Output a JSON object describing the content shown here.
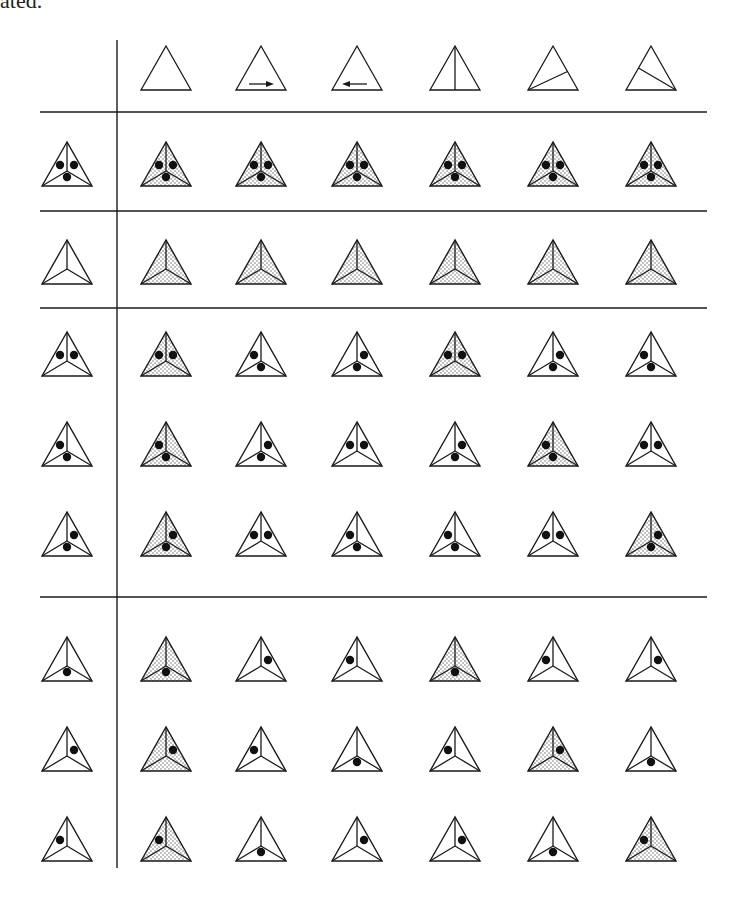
{
  "page": {
    "corner_text": "ated.",
    "background": "#ffffff",
    "ink": "#1a1a1a",
    "shade_dot": "#555555"
  },
  "grid": {
    "vertical_line": {
      "x": 117,
      "y1": 40,
      "y2": 868
    },
    "horizontal_lines": [
      {
        "y": 112,
        "x1": 40,
        "x2": 707
      },
      {
        "y": 211,
        "x1": 40,
        "x2": 707
      },
      {
        "y": 308,
        "x1": 40,
        "x2": 707
      },
      {
        "y": 597,
        "x1": 40,
        "x2": 707
      }
    ],
    "row_header_x": 67,
    "column_x": [
      166,
      261,
      357,
      455,
      553,
      651
    ],
    "header_row_y": 90,
    "row_y": [
      186,
      284,
      376,
      466,
      556,
      681,
      771,
      861
    ]
  },
  "column_headers": [
    {
      "id": "c1",
      "kind": "plain"
    },
    {
      "id": "c2",
      "kind": "arrow-right"
    },
    {
      "id": "c3",
      "kind": "arrow-left"
    },
    {
      "id": "c4",
      "kind": "vertical-split"
    },
    {
      "id": "c5",
      "kind": "split-bottom-left"
    },
    {
      "id": "c6",
      "kind": "split-bottom-right"
    }
  ],
  "rows": [
    {
      "id": "r1",
      "header": {
        "dots": "LRB",
        "shaded": false
      },
      "cells": [
        {
          "dots": "LRB",
          "shaded": true
        },
        {
          "dots": "LRB",
          "shaded": true
        },
        {
          "dots": "LRB",
          "shaded": true
        },
        {
          "dots": "LRB",
          "shaded": true
        },
        {
          "dots": "LRB",
          "shaded": true
        },
        {
          "dots": "LRB",
          "shaded": true
        }
      ]
    },
    {
      "id": "r2",
      "header": {
        "dots": "",
        "shaded": false
      },
      "cells": [
        {
          "dots": "",
          "shaded": true
        },
        {
          "dots": "",
          "shaded": true
        },
        {
          "dots": "",
          "shaded": true
        },
        {
          "dots": "",
          "shaded": true
        },
        {
          "dots": "",
          "shaded": true
        },
        {
          "dots": "",
          "shaded": true
        }
      ]
    },
    {
      "id": "r3",
      "header": {
        "dots": "LR",
        "shaded": false
      },
      "cells": [
        {
          "dots": "LR",
          "shaded": true
        },
        {
          "dots": "LB",
          "shaded": false
        },
        {
          "dots": "RB",
          "shaded": false
        },
        {
          "dots": "LR",
          "shaded": true
        },
        {
          "dots": "RB",
          "shaded": false
        },
        {
          "dots": "LB",
          "shaded": false
        }
      ]
    },
    {
      "id": "r4",
      "header": {
        "dots": "LB",
        "shaded": false
      },
      "cells": [
        {
          "dots": "LB",
          "shaded": true
        },
        {
          "dots": "RB",
          "shaded": false
        },
        {
          "dots": "LR",
          "shaded": false
        },
        {
          "dots": "RB",
          "shaded": false
        },
        {
          "dots": "LB",
          "shaded": true
        },
        {
          "dots": "LR",
          "shaded": false
        }
      ]
    },
    {
      "id": "r5",
      "header": {
        "dots": "RB",
        "shaded": false
      },
      "cells": [
        {
          "dots": "RB",
          "shaded": true
        },
        {
          "dots": "LR",
          "shaded": false
        },
        {
          "dots": "LB",
          "shaded": false
        },
        {
          "dots": "LB",
          "shaded": false
        },
        {
          "dots": "LR",
          "shaded": false
        },
        {
          "dots": "RB",
          "shaded": true
        }
      ]
    },
    {
      "id": "r6",
      "header": {
        "dots": "B",
        "shaded": false
      },
      "cells": [
        {
          "dots": "B",
          "shaded": true
        },
        {
          "dots": "R",
          "shaded": false
        },
        {
          "dots": "L",
          "shaded": false
        },
        {
          "dots": "B",
          "shaded": true
        },
        {
          "dots": "L",
          "shaded": false
        },
        {
          "dots": "R",
          "shaded": false
        }
      ]
    },
    {
      "id": "r7",
      "header": {
        "dots": "R",
        "shaded": false
      },
      "cells": [
        {
          "dots": "R",
          "shaded": true
        },
        {
          "dots": "L",
          "shaded": false
        },
        {
          "dots": "B",
          "shaded": false
        },
        {
          "dots": "L",
          "shaded": false
        },
        {
          "dots": "R",
          "shaded": true
        },
        {
          "dots": "B",
          "shaded": false
        }
      ]
    },
    {
      "id": "r8",
      "header": {
        "dots": "L",
        "shaded": false
      },
      "cells": [
        {
          "dots": "L",
          "shaded": true
        },
        {
          "dots": "B",
          "shaded": false
        },
        {
          "dots": "R",
          "shaded": false
        },
        {
          "dots": "R",
          "shaded": false
        },
        {
          "dots": "B",
          "shaded": false
        },
        {
          "dots": "L",
          "shaded": true
        }
      ]
    }
  ]
}
